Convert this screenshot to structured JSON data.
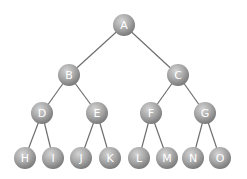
{
  "diagram": {
    "type": "binary-tree",
    "node_radius": 11,
    "colors": {
      "node_light": "#d4d4d4",
      "node_mid": "#a8a8a8",
      "node_dark": "#7a7a7a",
      "edge": "#6e6e6e",
      "label": "#ffffff"
    },
    "nodes": [
      {
        "id": "A",
        "label": "A",
        "x": 124,
        "y": 25
      },
      {
        "id": "B",
        "label": "B",
        "x": 69,
        "y": 75
      },
      {
        "id": "C",
        "label": "C",
        "x": 178,
        "y": 75
      },
      {
        "id": "D",
        "label": "D",
        "x": 42,
        "y": 113
      },
      {
        "id": "E",
        "label": "E",
        "x": 97,
        "y": 113
      },
      {
        "id": "F",
        "label": "F",
        "x": 151,
        "y": 113
      },
      {
        "id": "G",
        "label": "G",
        "x": 205,
        "y": 113
      },
      {
        "id": "H",
        "label": "H",
        "x": 25,
        "y": 158
      },
      {
        "id": "I",
        "label": "I",
        "x": 53,
        "y": 158
      },
      {
        "id": "J",
        "label": "J",
        "x": 81,
        "y": 158
      },
      {
        "id": "K",
        "label": "K",
        "x": 110,
        "y": 158
      },
      {
        "id": "L",
        "label": "L",
        "x": 139,
        "y": 158
      },
      {
        "id": "M",
        "label": "M",
        "x": 167,
        "y": 158
      },
      {
        "id": "N",
        "label": "N",
        "x": 193,
        "y": 158
      },
      {
        "id": "O",
        "label": "O",
        "x": 220,
        "y": 158
      }
    ],
    "edges": [
      [
        "A",
        "B"
      ],
      [
        "A",
        "C"
      ],
      [
        "B",
        "D"
      ],
      [
        "B",
        "E"
      ],
      [
        "C",
        "F"
      ],
      [
        "C",
        "G"
      ],
      [
        "D",
        "H"
      ],
      [
        "D",
        "I"
      ],
      [
        "E",
        "J"
      ],
      [
        "E",
        "K"
      ],
      [
        "F",
        "L"
      ],
      [
        "F",
        "M"
      ],
      [
        "G",
        "N"
      ],
      [
        "G",
        "O"
      ]
    ]
  }
}
